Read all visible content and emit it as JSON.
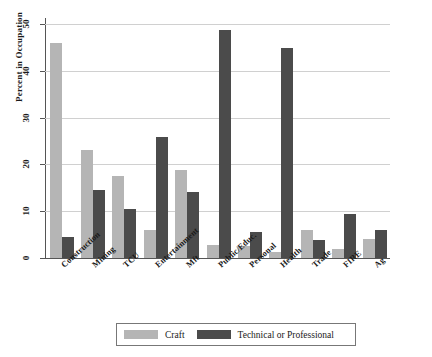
{
  "chart_data": {
    "type": "bar",
    "title": "",
    "subtitle": "",
    "xlabel": "",
    "ylabel": "Percent in Occupation",
    "ylim": [
      0,
      50
    ],
    "yticks": [
      0,
      10,
      20,
      30,
      40,
      50
    ],
    "ytick_labels": [
      "0",
      "10",
      "20",
      "30",
      "40",
      "50"
    ],
    "grid": true,
    "legend_position": "bottom",
    "categories": [
      "Construction",
      "Mining",
      "TCU",
      "Entertainment",
      "Mft",
      "Public/Educ.",
      "Personal",
      "Health",
      "Trade",
      "FIRE",
      "Ag"
    ],
    "series": [
      {
        "name": "Craft",
        "color": "#b5b5b5",
        "values": [
          46.0,
          23.0,
          17.5,
          6.0,
          18.7,
          2.8,
          2.5,
          1.3,
          6.0,
          2.0,
          4.0
        ]
      },
      {
        "name": "Technical or Professional",
        "color": "#4b4b4b",
        "values": [
          4.5,
          14.5,
          10.5,
          25.8,
          14.0,
          48.7,
          5.5,
          44.8,
          3.8,
          9.3,
          6.0
        ]
      }
    ],
    "legend": [
      "Craft",
      "Technical or Professional"
    ]
  }
}
